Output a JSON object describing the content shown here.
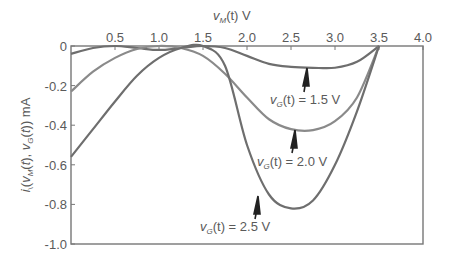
{
  "chart_data": {
    "type": "line",
    "title": "",
    "xlabel": "v_M(t) V",
    "ylabel": "i_\\(v_M(t), v_G(t)) mA",
    "xlim": [
      0,
      4.0
    ],
    "ylim": [
      -1.0,
      0
    ],
    "x_ticks": [
      "0.5",
      "1.0",
      "1.5",
      "2.0",
      "2.5",
      "3.0",
      "3.5",
      "4.0"
    ],
    "y_ticks": [
      "0",
      "-0.2",
      "-0.4",
      "-0.6",
      "-0.8",
      "-1.0"
    ],
    "x_axis_position": "top",
    "grid": false,
    "series": [
      {
        "name": "vG(t) = 1.5 V",
        "x": [
          0,
          0.25,
          0.5,
          0.75,
          1.0,
          1.25,
          1.5,
          1.75,
          2.0,
          2.25,
          2.5,
          2.75,
          3.0,
          3.25,
          3.5
        ],
        "y": [
          -0.04,
          -0.01,
          0.0,
          -0.01,
          -0.02,
          -0.01,
          0.0,
          -0.01,
          -0.05,
          -0.09,
          -0.105,
          -0.11,
          -0.11,
          -0.08,
          0.0
        ]
      },
      {
        "name": "vG(t) = 2.0 V",
        "x": [
          0,
          0.25,
          0.5,
          0.75,
          1.0,
          1.25,
          1.5,
          1.75,
          2.0,
          2.25,
          2.5,
          2.75,
          3.0,
          3.25,
          3.5
        ],
        "y": [
          -0.23,
          -0.13,
          -0.06,
          -0.015,
          0.0,
          -0.01,
          -0.05,
          -0.14,
          -0.26,
          -0.37,
          -0.42,
          -0.425,
          -0.38,
          -0.26,
          0.0
        ]
      },
      {
        "name": "vG(t) = 2.5 V",
        "x": [
          0,
          0.25,
          0.5,
          0.75,
          1.0,
          1.25,
          1.5,
          1.75,
          2.0,
          2.25,
          2.5,
          2.75,
          3.0,
          3.25,
          3.5
        ],
        "y": [
          -0.56,
          -0.42,
          -0.28,
          -0.15,
          -0.06,
          -0.01,
          0.0,
          -0.1,
          -0.5,
          -0.75,
          -0.82,
          -0.78,
          -0.6,
          -0.33,
          0.0
        ]
      }
    ],
    "annotations": [
      {
        "text": "vG(t) = 1.5 V",
        "arrow_to": [
          2.55,
          -0.11
        ]
      },
      {
        "text": "vG(t) = 2.0 V",
        "arrow_to": [
          2.55,
          -0.42
        ]
      },
      {
        "text": "vG(t) = 2.5 V",
        "arrow_to": [
          2.2,
          -0.73
        ]
      }
    ],
    "line_colors": [
      "#6e6e6e",
      "#8a8a8a",
      "#6e6e6e"
    ]
  },
  "labels": {
    "xlabel_main": "v",
    "xlabel_sub": "M",
    "xlabel_rest": "(t) V",
    "ylabel": "i\\(vM(t), vG(t)) mA",
    "ann1_v": "v",
    "ann1_sub": "G",
    "ann1_rest": "(t) = 1.5 V",
    "ann2_v": "v",
    "ann2_sub": "G",
    "ann2_rest": "(t) = 2.0 V",
    "ann3_v": "v",
    "ann3_sub": "G",
    "ann3_rest": "(t) = 2.5 V"
  }
}
